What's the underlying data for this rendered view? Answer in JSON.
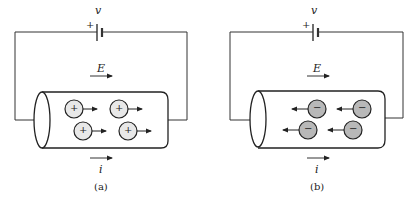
{
  "panels": [
    {
      "id": "a",
      "caption": "(a)",
      "voltage_label": "v",
      "plus_sign": "+",
      "field_label": "E",
      "current_label": "i",
      "carrier_sign": "+",
      "carrier_direction": "right",
      "carrier_fill": "#e8e8e8"
    },
    {
      "id": "b",
      "caption": "(b)",
      "voltage_label": "v",
      "plus_sign": "+",
      "field_label": "E",
      "current_label": "i",
      "carrier_sign": "−",
      "carrier_direction": "left",
      "carrier_fill": "#b8b8b8"
    }
  ]
}
